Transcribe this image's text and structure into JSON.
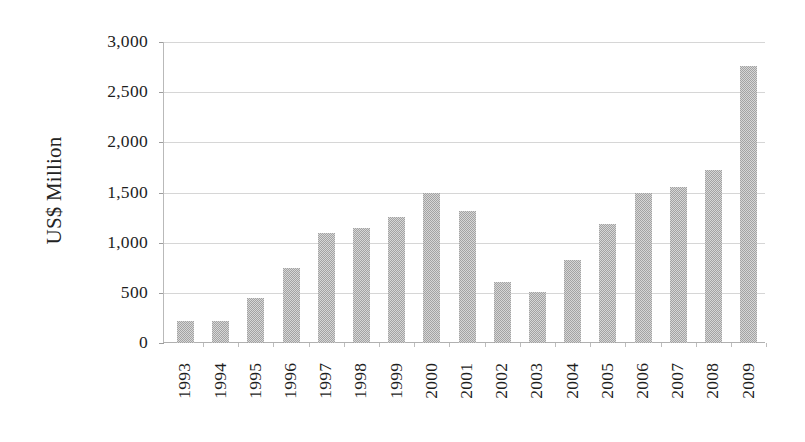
{
  "chart_data": {
    "type": "bar",
    "title": "",
    "subtitle": "",
    "xlabel": "",
    "ylabel": "US$ Million",
    "categories": [
      "1993",
      "1994",
      "1995",
      "1996",
      "1997",
      "1998",
      "1999",
      "2000",
      "2001",
      "2002",
      "2003",
      "2004",
      "2005",
      "2006",
      "2007",
      "2008",
      "2009"
    ],
    "values": [
      215,
      220,
      450,
      750,
      1100,
      1150,
      1255,
      1500,
      1320,
      610,
      505,
      830,
      1190,
      1500,
      1555,
      1720,
      2760
    ],
    "series": [
      {
        "name": "US$ Million",
        "values": [
          215,
          220,
          450,
          750,
          1100,
          1150,
          1255,
          1500,
          1320,
          610,
          505,
          830,
          1190,
          1500,
          1555,
          1720,
          2760
        ]
      }
    ],
    "ylim": [
      0,
      3000
    ],
    "y_ticks": [
      0,
      500,
      1000,
      1500,
      2000,
      2500,
      3000
    ],
    "y_tick_labels": [
      "0",
      "500",
      "1,000",
      "1,500",
      "2,000",
      "2,500",
      "3,000"
    ],
    "grid": true,
    "legend": false,
    "legend_position": "none",
    "bar_color": "#9d9d9d",
    "gridline_color": "#d6d6d6",
    "axis_color": "#b9b9b9",
    "text_color": "#1d1d1d",
    "background_color": "#ffffff",
    "x_tick_rotation": 90
  }
}
